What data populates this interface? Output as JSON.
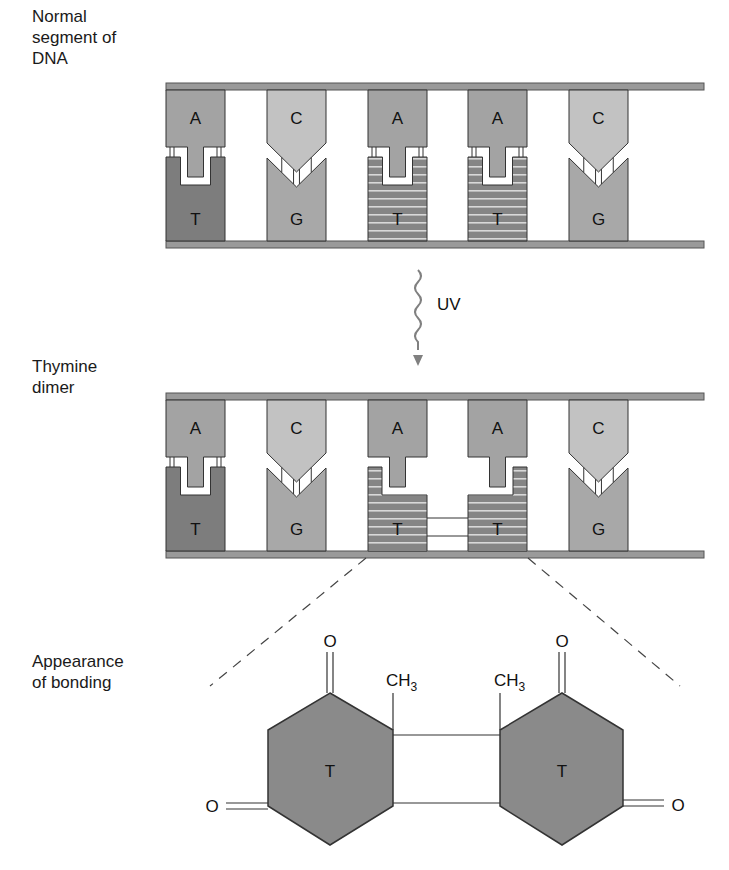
{
  "labels": {
    "panel_normal": "Normal\nsegment of\nDNA",
    "panel_dimer": "Thymine\ndimer",
    "panel_bonding": "Appearance\nof bonding",
    "uv": "UV"
  },
  "colors": {
    "strand": "#9a9a9a",
    "strand_edge": "#555555",
    "adenine": "#a3a3a3",
    "thymine_solid": "#7d7d7d",
    "thymine_striped": "#858585",
    "stripe": "#d8d8d8",
    "cytosine": "#c2c2c2",
    "guanine": "#a8a8a8",
    "hexagon": "#8a8a8a",
    "outline": "#333333",
    "uv_arrow": "#808080"
  },
  "panels": [
    {
      "name": "normal-segment",
      "pairs": [
        {
          "top": "A",
          "bottom": "T",
          "bottom_style": "solid",
          "dimer": false
        },
        {
          "top": "C",
          "bottom": "G",
          "bottom_style": "solid",
          "dimer": false
        },
        {
          "top": "A",
          "bottom": "T",
          "bottom_style": "striped",
          "dimer": false
        },
        {
          "top": "A",
          "bottom": "T",
          "bottom_style": "striped",
          "dimer": false
        },
        {
          "top": "C",
          "bottom": "G",
          "bottom_style": "solid",
          "dimer": false
        }
      ]
    },
    {
      "name": "thymine-dimer",
      "pairs": [
        {
          "top": "A",
          "bottom": "T",
          "bottom_style": "solid",
          "dimer": false
        },
        {
          "top": "C",
          "bottom": "G",
          "bottom_style": "solid",
          "dimer": false
        },
        {
          "top": "A",
          "bottom": "T",
          "bottom_style": "striped",
          "dimer": "left"
        },
        {
          "top": "A",
          "bottom": "T",
          "bottom_style": "striped",
          "dimer": "right"
        },
        {
          "top": "C",
          "bottom": "G",
          "bottom_style": "solid",
          "dimer": false
        }
      ]
    }
  ],
  "bonding": {
    "left_ring_label": "T",
    "right_ring_label": "T",
    "oxygen": "O",
    "methyl": "CH",
    "methyl_sub": "3"
  }
}
